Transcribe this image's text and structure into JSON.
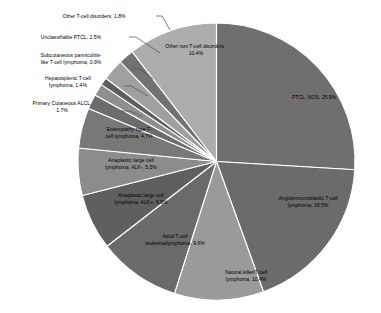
{
  "chart_data": {
    "type": "pie",
    "title": "",
    "legend_position": "none",
    "labels_mode": "data-labels-with-leader-lines",
    "categories": [
      "PTCL, NOS",
      "Angioimmunoblastic T-cell lymphoma",
      "Natural killer/T-cell lymphoma",
      "Adult T-cell leukemia/lymphoma",
      "Anaplastic large cell lymphoma, ALK+",
      "Anaplastic large cell lymphoma, ALK-",
      "Enteropathy-type T-cell lymphoma",
      "Primary Cutaneous ALCL",
      "Hepatosplenic T-cell lymphoma",
      "Subcutaneous panniculitis-like T-cell lymphoma",
      "Unclassifiable PTCL",
      "Other T-cell disorders",
      "Other non T-cell disorders"
    ],
    "values": [
      25.9,
      18.5,
      10.4,
      9.6,
      6.5,
      5.5,
      4.7,
      1.7,
      1.4,
      0.9,
      2.5,
      1.8,
      10.4
    ],
    "units": "%",
    "slices": [
      {
        "label": "PTCL, NOS, 25.9%",
        "name": "PTCL, NOS",
        "value": 25.9,
        "color": "#6f6f6f",
        "placement": "inside"
      },
      {
        "label": "Angioimmunoblastic T-cell lymphoma, 18.5%",
        "name": "Angioimmunoblastic T-cell lymphoma",
        "value": 18.5,
        "color": "#6b6b6b",
        "placement": "inside"
      },
      {
        "label": "Natural killer/T-cell lymphoma, 10.4%",
        "name": "Natural killer/T-cell lymphoma",
        "value": 10.4,
        "color": "#9a9a9a",
        "placement": "inside"
      },
      {
        "label": "Adult T-cell leukemia/lymphoma, 9.6%",
        "name": "Adult T-cell leukemia/lymphoma",
        "value": 9.6,
        "color": "#6a6a6a",
        "placement": "inside"
      },
      {
        "label": "Anaplastic large cell lymphoma, ALK+, 6.5%",
        "name": "Anaplastic large cell lymphoma, ALK+",
        "value": 6.5,
        "color": "#5f5f5f",
        "placement": "inside"
      },
      {
        "label": "Anaplastic large cell lymphoma, ALK-, 5.5%",
        "name": "Anaplastic large cell lymphoma, ALK-",
        "value": 5.5,
        "color": "#8c8c8c",
        "placement": "inside"
      },
      {
        "label": "Enteropathy-type T-cell lymphoma, 4.7%",
        "name": "Enteropathy-type T-cell lymphoma",
        "value": 4.7,
        "color": "#787878",
        "placement": "inside"
      },
      {
        "label": "Primary Cutaneous ALCL, 1.7%",
        "name": "Primary Cutaneous ALCL",
        "value": 1.7,
        "color": "#6c6c6c",
        "placement": "outside"
      },
      {
        "label": "Hepatosplenic T-cell lymphoma, 1.4%",
        "name": "Hepatosplenic T-cell lymphoma",
        "value": 1.4,
        "color": "#8f8f8f",
        "placement": "outside"
      },
      {
        "label": "Subcutaneous panniculitis-like T-cell lymphoma, 0.9%",
        "name": "Subcutaneous panniculitis-like T-cell lymphoma",
        "value": 0.9,
        "color": "#5e5e5e",
        "placement": "outside"
      },
      {
        "label": "Unclassifiable PTCL, 2.5%",
        "name": "Unclassifiable PTCL",
        "value": 2.5,
        "color": "#9f9f9f",
        "placement": "outside"
      },
      {
        "label": "Other T-cell disorders, 1.8%",
        "name": "Other T-cell disorders",
        "value": 1.8,
        "color": "#727272",
        "placement": "outside"
      },
      {
        "label": "Other non T-cell disorders , 10.4%",
        "name": "Other non T-cell disorders",
        "value": 10.4,
        "color": "#adadad",
        "placement": "inside"
      }
    ],
    "labels_text": {
      "ptcl_nos": "PTCL, NOS, 25.9%",
      "aitl": "Angioimmunoblastic T-cell lymphoma, 18.5%",
      "nk_t": "Natural killer/T-cell lymphoma, 10.4%",
      "atll": "Adult T-cell leukemia/lymphoma, 9.6%",
      "alcl_pos": "Anaplastic large cell lymphoma, ALK+, 6.5%",
      "alcl_neg": "Anaplastic large cell lymphoma, ALK-, 5.5%",
      "eatl": "Enteropathy-type T-cell lymphoma, 4.7%",
      "pcalcl": "Primary Cutaneous ALCL, 1.7%",
      "hstcl": "Hepatosplenic T-cell lymphoma, 1.4%",
      "spltcl": "Subcutaneous panniculitis-like T-cell lymphoma, 0.9%",
      "unclassifiable": "Unclassifiable PTCL, 2.5%",
      "other_tcell": "Other T-cell disorders, 1.8%",
      "other_non_tcell": "Other non T-cell disorders , 10.4%"
    },
    "label_lines": {
      "ptcl_nos": [
        "PTCL, NOS, 25.9%"
      ],
      "aitl": [
        "Angioimmunoblastic T-cell",
        "lymphoma, 18.5%"
      ],
      "nk_t": [
        "Natural killer/T-cell",
        "lymphoma, 10.4%"
      ],
      "atll": [
        "Adult T-cell",
        "leukemia/lymphoma, 9.6%"
      ],
      "alcl_pos": [
        "Anaplastic large cell",
        "lymphoma, ALK+, 6.5%"
      ],
      "alcl_neg": [
        "Anaplastic large cell",
        "lymphoma, ALK-, 5.5%"
      ],
      "eatl": [
        "Enteropathy-type T-",
        "cell lymphoma, 4.7%"
      ],
      "pcalcl": [
        "Primary Cutaneous ALCL,",
        "1.7%"
      ],
      "hstcl": [
        "Hepatosplenic T-cell",
        "lymphoma, 1.4%"
      ],
      "spltcl": [
        "Subcutaneous panniculitis-",
        "like T-cell lymphoma, 0.9%"
      ],
      "unclassifiable": [
        "Unclassifiable PTCL, 2.5%"
      ],
      "other_tcell": [
        "Other T-cell disorders, 1.8%"
      ],
      "other_non_tcell": [
        "Other non T-cell disorders ,",
        "10.4%"
      ]
    }
  }
}
